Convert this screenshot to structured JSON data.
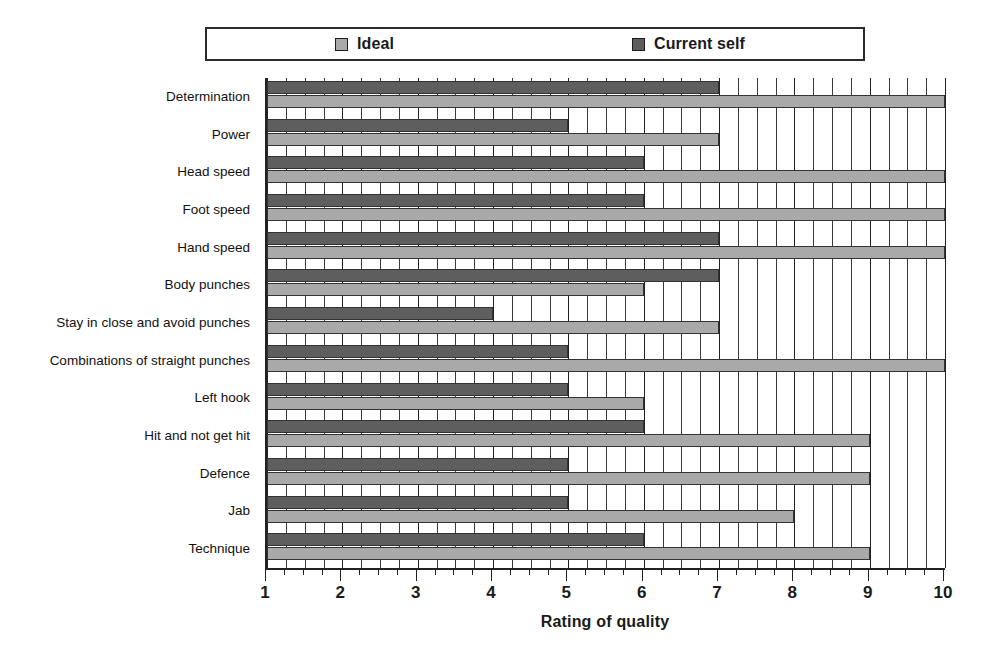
{
  "chart_data": {
    "type": "bar",
    "orientation": "horizontal",
    "title": "",
    "xlabel": "Rating of quality",
    "ylabel": "",
    "xlim": [
      1,
      10
    ],
    "xticks": [
      1,
      2,
      3,
      4,
      5,
      6,
      7,
      8,
      9,
      10
    ],
    "xtick_labels": [
      "1",
      "2",
      "3",
      "4",
      "5",
      "6",
      "7",
      "8",
      "9",
      "10"
    ],
    "minor_tick_step": 0.25,
    "grid": true,
    "grid_axis": "x",
    "legend_position": "top",
    "categories": [
      "Determination",
      "Power",
      "Head speed",
      "Foot speed",
      "Hand speed",
      "Body punches",
      "Stay in close and avoid punches",
      "Combinations of straight punches",
      "Left hook",
      "Hit and not get hit",
      "Defence",
      "Jab",
      "Technique"
    ],
    "series": [
      {
        "name": "Current self",
        "color": "#5e5e5e",
        "values": [
          7,
          5,
          6,
          6,
          7,
          7,
          4,
          5,
          5,
          6,
          5,
          5,
          6
        ]
      },
      {
        "name": "Ideal",
        "color": "#a9a9a9",
        "values": [
          10,
          7,
          10,
          10,
          10,
          6,
          7,
          10,
          6,
          9,
          9,
          8,
          9
        ]
      }
    ]
  },
  "legend": {
    "entries": [
      {
        "label": "Ideal",
        "color": "#a9a9a9"
      },
      {
        "label": "Current self",
        "color": "#5e5e5e"
      }
    ]
  },
  "axis": {
    "x_title": "Rating of quality"
  }
}
